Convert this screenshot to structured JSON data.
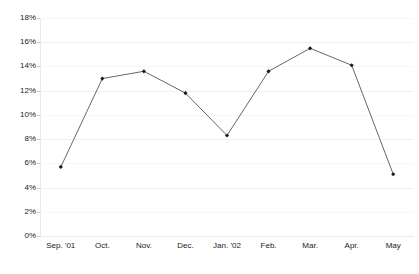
{
  "chart_data": {
    "type": "line",
    "title": "",
    "xlabel": "",
    "ylabel": "",
    "categories": [
      "Sep. '01",
      "Oct.",
      "Nov.",
      "Dec.",
      "Jan. '02",
      "Feb.",
      "Mar.",
      "Apr.",
      "May"
    ],
    "values": [
      5.7,
      13.0,
      13.6,
      11.8,
      8.3,
      13.6,
      15.5,
      14.1,
      5.1
    ],
    "series": [
      {
        "name": "",
        "values": [
          5.7,
          13.0,
          13.6,
          11.8,
          8.3,
          13.6,
          15.5,
          14.1,
          5.1
        ]
      }
    ],
    "ylim": [
      0,
      18
    ],
    "ytick_labels": [
      "0%",
      "2%",
      "4%",
      "6%",
      "8%",
      "10%",
      "12%",
      "14%",
      "16%",
      "18%"
    ],
    "ytick_values": [
      0,
      2,
      4,
      6,
      8,
      10,
      12,
      14,
      16,
      18
    ],
    "grid": true,
    "grid_axis": "y",
    "legend": false,
    "legend_position": "none",
    "value_format": "percent",
    "marker": "diamond",
    "colors": {
      "line": "#555555",
      "marker": "#1a1a1a",
      "grid": "#f0f0f0",
      "axis": "#e9e9e9",
      "text": "#1a1a1a",
      "background": "#ffffff"
    }
  },
  "title_remnant": {
    "text": ""
  }
}
